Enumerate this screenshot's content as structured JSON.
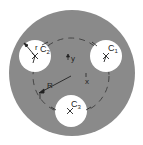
{
  "diagram": {
    "colors": {
      "disk": "#8a8a8a",
      "hole": "#ffffff",
      "line": "#222222",
      "dashed": "#333333"
    },
    "disk": {
      "cx": 72,
      "cy": 73,
      "r": 63
    },
    "pitch_circle": {
      "cx": 71,
      "cy": 76,
      "r": 38
    },
    "holes": [
      {
        "id": "C1",
        "label": "C",
        "sub": "1",
        "cx": 106,
        "cy": 56,
        "r": 16
      },
      {
        "id": "C2",
        "label": "C",
        "sub": "2",
        "cx": 35,
        "cy": 56,
        "r": 16
      },
      {
        "id": "C3",
        "label": "C",
        "sub": "3",
        "cx": 71,
        "cy": 111,
        "r": 16
      }
    ],
    "labels": {
      "r": "r",
      "R": "R",
      "x": "x",
      "y": "y"
    }
  }
}
